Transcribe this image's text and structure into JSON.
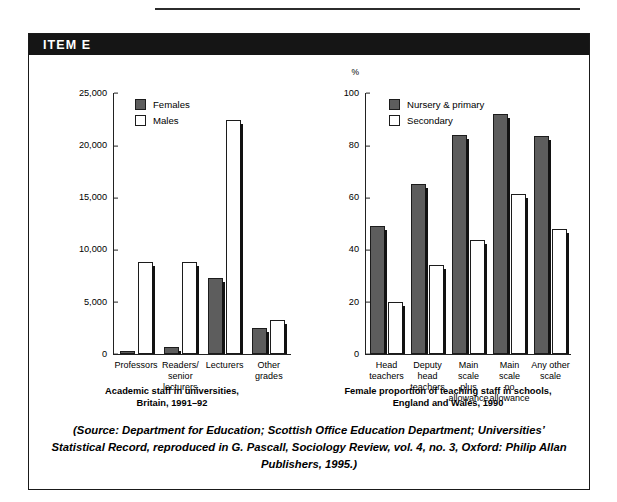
{
  "item": {
    "label": "ITEM E"
  },
  "source": "(Source: Department for Education; Scottish Office Education Department; Universities’ Statistical Record, reproduced in G. Pascall, Sociology Review, vol. 4, no. 3, Oxford: Philip Allan Publishers, 1995.)",
  "colors": {
    "dark_bar": "#5d5d5d",
    "light_bar": "#ffffff",
    "outline": "#1c1c1c",
    "band": "#151515"
  },
  "chart_data": [
    {
      "type": "bar",
      "title": "Academic staff in universities,\nBritain, 1991–92",
      "xlabel": "",
      "ylabel": "",
      "unit": "",
      "ylim": [
        0,
        25000
      ],
      "yticks": [
        "0",
        "5,000",
        "10,000",
        "15,000",
        "20,000",
        "25,000"
      ],
      "ytick_values": [
        0,
        5000,
        10000,
        15000,
        20000,
        25000
      ],
      "grid": false,
      "legend_position": "top-left",
      "categories": [
        "Professors",
        "Readers/\nsenior\nlecturers",
        "Lecturers",
        "Other\ngrades"
      ],
      "series": [
        {
          "name": "Females",
          "values": [
            250,
            700,
            7300,
            2500
          ]
        },
        {
          "name": "Males",
          "values": [
            8800,
            8800,
            22400,
            3300
          ]
        }
      ]
    },
    {
      "type": "bar",
      "title": "Female proportion of teaching staff in schools,\nEngland and Wales, 1990",
      "xlabel": "",
      "ylabel": "",
      "unit": "%",
      "ylim": [
        0,
        100
      ],
      "yticks": [
        "0",
        "20",
        "40",
        "60",
        "80",
        "100"
      ],
      "ytick_values": [
        0,
        20,
        40,
        60,
        80,
        100
      ],
      "grid": false,
      "legend_position": "top-left",
      "categories": [
        "Head\nteachers",
        "Deputy\nhead\nteachers",
        "Main scale\nplus\nallowance",
        "Main scale\nno\nallowance",
        "Any other\nscale"
      ],
      "series": [
        {
          "name": "Nursery & primary",
          "values": [
            49,
            65,
            84,
            92,
            83.5
          ]
        },
        {
          "name": "Secondary",
          "values": [
            20,
            34,
            43.5,
            61.5,
            48
          ]
        }
      ]
    }
  ]
}
